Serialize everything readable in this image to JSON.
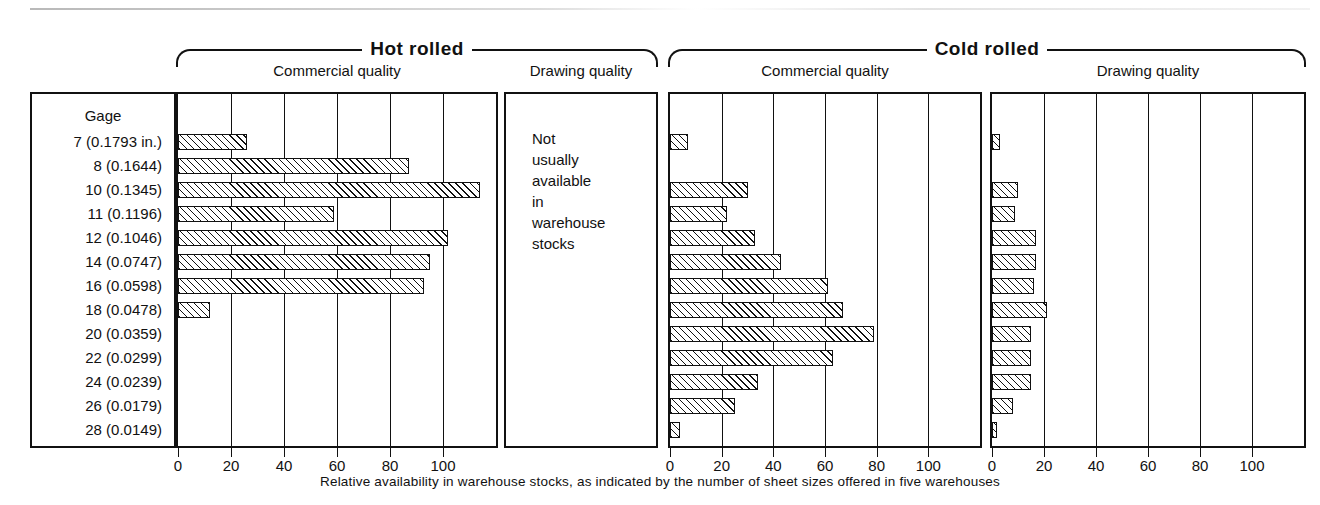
{
  "figure": {
    "caption": "Relative availability in warehouse stocks, as indicated by the number of sheet sizes offered in five warehouses",
    "gage_header": "Gage",
    "note_lines": [
      "Not",
      "usually",
      "available",
      "in",
      "warehouse",
      "stocks"
    ]
  },
  "groups": [
    {
      "title": "Hot rolled",
      "subtitles": [
        "Commercial quality",
        "Drawing quality"
      ]
    },
    {
      "title": "Cold rolled",
      "subtitles": [
        "Commercial quality",
        "Drawing quality"
      ]
    }
  ],
  "axis": {
    "ticks": [
      "0",
      "20",
      "40",
      "60",
      "80",
      "100"
    ],
    "tick_values": [
      0,
      20,
      40,
      60,
      80,
      100
    ],
    "min": 0,
    "max": 120
  },
  "chart_data": {
    "type": "bar",
    "title": "",
    "xlabel": "Relative availability in warehouse stocks, as indicated by the number of sheet sizes offered in five warehouses",
    "ylabel": "Gage",
    "xlim": [
      0,
      120
    ],
    "grid": true,
    "orientation": "horizontal",
    "legend": "none",
    "categories": [
      "7 (0.1793 in.)",
      "8 (0.1644)",
      "10 (0.1345)",
      "11 (0.1196)",
      "12 (0.1046)",
      "14 (0.0747)",
      "16 (0.0598)",
      "18 (0.0478)",
      "20 (0.0359)",
      "22 (0.0299)",
      "24 (0.0239)",
      "26 (0.0179)",
      "28 (0.0149)"
    ],
    "series": [
      {
        "name": "Hot rolled - Commercial quality",
        "values": [
          26,
          87,
          114,
          59,
          102,
          95,
          93,
          12,
          0,
          0,
          0,
          0,
          0
        ]
      },
      {
        "name": "Hot rolled - Drawing quality",
        "values": [
          0,
          0,
          0,
          0,
          0,
          0,
          0,
          0,
          0,
          0,
          0,
          0,
          0
        ],
        "note": "Not usually available in warehouse stocks"
      },
      {
        "name": "Cold rolled - Commercial quality",
        "values": [
          7,
          0,
          30,
          22,
          33,
          43,
          61,
          67,
          79,
          63,
          34,
          25,
          4
        ]
      },
      {
        "name": "Cold rolled - Drawing quality",
        "values": [
          3,
          0,
          10,
          9,
          17,
          17,
          16,
          21,
          15,
          15,
          15,
          8,
          2
        ]
      }
    ]
  }
}
